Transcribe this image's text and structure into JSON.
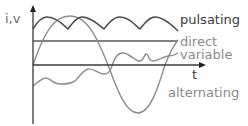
{
  "diagram": {
    "y_axis_label": "i,v",
    "x_axis_label": "t",
    "colors": {
      "axis": "#3a3a3a",
      "pulsating": "#4a4a4a",
      "direct": "#5a5a5a",
      "variable": "#8c8c8c",
      "alternating": "#8c8c8c",
      "label_dark": "#3a3a3a",
      "label_light": "#8a8a8a"
    },
    "series": [
      {
        "name": "pulsating",
        "label": "pulsating"
      },
      {
        "name": "direct",
        "label": "direct"
      },
      {
        "name": "variable",
        "label": "variable"
      },
      {
        "name": "alternating",
        "label": "alternating"
      }
    ]
  }
}
